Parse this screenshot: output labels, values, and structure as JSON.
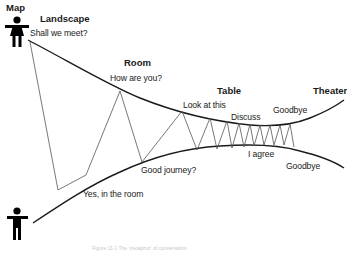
{
  "title": "Map",
  "stages": [
    {
      "label": "Landscape",
      "x": 40,
      "y": 14
    },
    {
      "label": "Room",
      "x": 124,
      "y": 58
    },
    {
      "label": "Table",
      "x": 217,
      "y": 86
    },
    {
      "label": "Theater",
      "x": 314,
      "y": 86
    }
  ],
  "messages": [
    {
      "label": "Shall we meet?",
      "x": 30,
      "y": 29
    },
    {
      "label": "How are you?",
      "x": 110,
      "y": 74
    },
    {
      "label": "Look at this",
      "x": 183,
      "y": 101
    },
    {
      "label": "Discuss",
      "x": 231,
      "y": 113
    },
    {
      "label": "Goodbye",
      "x": 273,
      "y": 106
    },
    {
      "label": "I agree",
      "x": 248,
      "y": 150
    },
    {
      "label": "Goodbye",
      "x": 286,
      "y": 162
    },
    {
      "label": "Good journey?",
      "x": 141,
      "y": 166
    },
    {
      "label": "Yes, in the room",
      "x": 83,
      "y": 190
    }
  ],
  "participants": [
    {
      "name": "person-top",
      "type": "female",
      "x": 6,
      "y": 18
    },
    {
      "name": "person-bottom",
      "type": "male",
      "x": 6,
      "y": 207
    }
  ],
  "caption": "Figure 11-1 The 'metaphor' of conversation",
  "colors": {
    "curve": "#1a1a1a",
    "zigzag": "#555555",
    "text": "#1a1a1a",
    "caption": "#c8c8c8"
  }
}
